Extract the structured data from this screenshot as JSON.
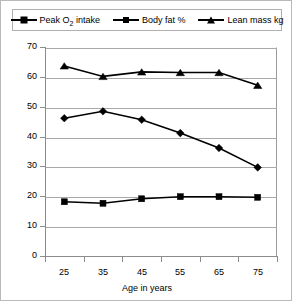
{
  "chart_data": {
    "type": "line",
    "title": "",
    "xlabel": "Age in years",
    "ylabel": "",
    "categories": [
      "25",
      "35",
      "45",
      "55",
      "65",
      "75"
    ],
    "x": [
      25,
      35,
      45,
      55,
      65,
      75
    ],
    "ylim": [
      0,
      70
    ],
    "yticks": [
      0,
      10,
      20,
      30,
      40,
      50,
      60,
      70
    ],
    "ytick_labels": [
      "0",
      "10",
      "20",
      "30",
      "40",
      "50",
      "60",
      "70"
    ],
    "grid": true,
    "legend_position": "top",
    "series": [
      {
        "name": "Peak O2 intake",
        "label_html": "Peak O<sub>2</sub> intake",
        "marker": "diamond",
        "color": "#000000",
        "values": [
          46.5,
          48.8,
          46.0,
          41.5,
          36.5,
          30.0
        ]
      },
      {
        "name": "Body fat %",
        "label_html": "Body fat %",
        "marker": "square",
        "color": "#000000",
        "values": [
          18.5,
          18.0,
          19.5,
          20.2,
          20.2,
          20.0
        ]
      },
      {
        "name": "Lean mass kg",
        "label_html": "Lean mass kg",
        "marker": "triangle",
        "color": "#000000",
        "values": [
          64.0,
          60.5,
          62.0,
          61.8,
          61.8,
          57.5
        ]
      }
    ]
  },
  "legend": {
    "items": [
      {
        "label": "Peak O2 intake",
        "marker": "diamond"
      },
      {
        "label": "Body fat %",
        "marker": "square"
      },
      {
        "label": "Lean mass kg",
        "marker": "triangle"
      }
    ]
  },
  "axes": {
    "x_title": "Age in years",
    "x_labels": [
      "25",
      "35",
      "45",
      "55",
      "65",
      "75"
    ],
    "y_labels": [
      "70",
      "60",
      "50",
      "40",
      "30",
      "20",
      "10",
      "0"
    ]
  }
}
